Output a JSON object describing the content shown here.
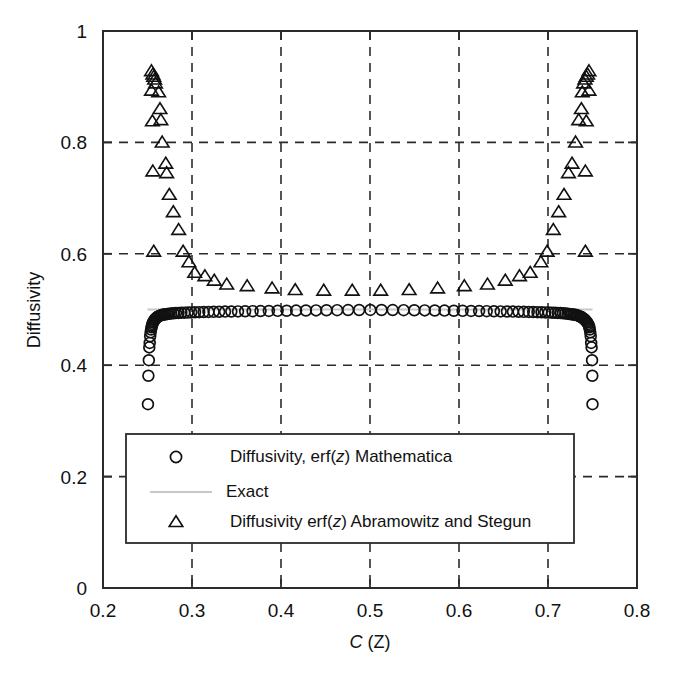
{
  "figure": {
    "background": "#ffffff",
    "axis_color": "#2b2b2b",
    "marker_color": "#111111",
    "exact_color": "#c8c8c8"
  },
  "chart_data": {
    "type": "scatter",
    "title": "",
    "xlabel": "C (Z)",
    "xlabel_italic_part": "C",
    "xlabel_rest": " (Z)",
    "ylabel": "Diffusivity",
    "xlim": [
      0.2,
      0.8
    ],
    "ylim": [
      0,
      1
    ],
    "xticks": [
      0.2,
      0.3,
      0.4,
      0.5,
      0.6,
      0.7,
      0.8
    ],
    "xtick_labels": [
      "0.2",
      "0.3",
      "0.4",
      "0.5",
      "0.6",
      "0.7",
      "0.8"
    ],
    "yticks": [
      0,
      0.2,
      0.4,
      0.6,
      0.8,
      1
    ],
    "ytick_labels": [
      "0",
      "0.2",
      "0.4",
      "0.6",
      "0.8",
      "1"
    ],
    "grid": true,
    "grid_style": "dashed",
    "legend_position": "lower-center",
    "series": [
      {
        "name": "Diffusivity, erf(z) Mathematica",
        "marker": "circle",
        "points": [
          [
            0.2505,
            0.33
          ],
          [
            0.251,
            0.381
          ],
          [
            0.2515,
            0.409
          ],
          [
            0.252,
            0.432
          ],
          [
            0.2525,
            0.44
          ],
          [
            0.253,
            0.452
          ],
          [
            0.2535,
            0.459
          ],
          [
            0.254,
            0.464
          ],
          [
            0.2545,
            0.468
          ],
          [
            0.255,
            0.471
          ],
          [
            0.2556,
            0.474
          ],
          [
            0.2562,
            0.477
          ],
          [
            0.257,
            0.479
          ],
          [
            0.2578,
            0.481
          ],
          [
            0.2586,
            0.483
          ],
          [
            0.2595,
            0.484
          ],
          [
            0.2605,
            0.486
          ],
          [
            0.2616,
            0.487
          ],
          [
            0.2628,
            0.488
          ],
          [
            0.2641,
            0.489
          ],
          [
            0.2655,
            0.49
          ],
          [
            0.267,
            0.4905
          ],
          [
            0.2686,
            0.491
          ],
          [
            0.2704,
            0.4915
          ],
          [
            0.2723,
            0.492
          ],
          [
            0.2744,
            0.4925
          ],
          [
            0.2767,
            0.493
          ],
          [
            0.2792,
            0.4932
          ],
          [
            0.2819,
            0.4935
          ],
          [
            0.2848,
            0.4938
          ],
          [
            0.288,
            0.494
          ],
          [
            0.2914,
            0.4943
          ],
          [
            0.2951,
            0.4945
          ],
          [
            0.2991,
            0.4948
          ],
          [
            0.3034,
            0.495
          ],
          [
            0.3081,
            0.4952
          ],
          [
            0.3131,
            0.4954
          ],
          [
            0.3185,
            0.4956
          ],
          [
            0.3243,
            0.4958
          ],
          [
            0.3305,
            0.496
          ],
          [
            0.3371,
            0.4962
          ],
          [
            0.3442,
            0.4964
          ],
          [
            0.3517,
            0.4966
          ],
          [
            0.3597,
            0.4968
          ],
          [
            0.3681,
            0.497
          ],
          [
            0.377,
            0.4972
          ],
          [
            0.3864,
            0.4974
          ],
          [
            0.3962,
            0.4976
          ],
          [
            0.4064,
            0.4978
          ],
          [
            0.417,
            0.498
          ],
          [
            0.428,
            0.4982
          ],
          [
            0.4394,
            0.4984
          ],
          [
            0.4511,
            0.4986
          ],
          [
            0.4631,
            0.4988
          ],
          [
            0.4754,
            0.499
          ],
          [
            0.4878,
            0.4991
          ],
          [
            0.5004,
            0.4992
          ],
          [
            0.513,
            0.4991
          ],
          [
            0.5255,
            0.499
          ],
          [
            0.5378,
            0.4988
          ],
          [
            0.5498,
            0.4986
          ],
          [
            0.5615,
            0.4984
          ],
          [
            0.5728,
            0.4982
          ],
          [
            0.5837,
            0.498
          ],
          [
            0.5942,
            0.4978
          ],
          [
            0.6041,
            0.4976
          ],
          [
            0.6136,
            0.4974
          ],
          [
            0.6226,
            0.4972
          ],
          [
            0.6311,
            0.497
          ],
          [
            0.6392,
            0.4968
          ],
          [
            0.6468,
            0.4966
          ],
          [
            0.6539,
            0.4964
          ],
          [
            0.6606,
            0.4962
          ],
          [
            0.6669,
            0.496
          ],
          [
            0.6728,
            0.4958
          ],
          [
            0.6783,
            0.4956
          ],
          [
            0.6834,
            0.4954
          ],
          [
            0.6882,
            0.4952
          ],
          [
            0.6927,
            0.495
          ],
          [
            0.6969,
            0.4948
          ],
          [
            0.7008,
            0.4945
          ],
          [
            0.7045,
            0.4943
          ],
          [
            0.7079,
            0.494
          ],
          [
            0.7111,
            0.4938
          ],
          [
            0.7141,
            0.4935
          ],
          [
            0.7169,
            0.4932
          ],
          [
            0.7195,
            0.493
          ],
          [
            0.7219,
            0.4925
          ],
          [
            0.7242,
            0.492
          ],
          [
            0.7264,
            0.4915
          ],
          [
            0.7284,
            0.491
          ],
          [
            0.7303,
            0.4905
          ],
          [
            0.7321,
            0.49
          ],
          [
            0.7337,
            0.489
          ],
          [
            0.7353,
            0.488
          ],
          [
            0.7367,
            0.487
          ],
          [
            0.7381,
            0.486
          ],
          [
            0.7394,
            0.484
          ],
          [
            0.7406,
            0.483
          ],
          [
            0.7418,
            0.481
          ],
          [
            0.7429,
            0.479
          ],
          [
            0.744,
            0.477
          ],
          [
            0.745,
            0.474
          ],
          [
            0.746,
            0.471
          ],
          [
            0.7465,
            0.468
          ],
          [
            0.747,
            0.464
          ],
          [
            0.7475,
            0.459
          ],
          [
            0.748,
            0.452
          ],
          [
            0.7485,
            0.44
          ],
          [
            0.749,
            0.432
          ],
          [
            0.7495,
            0.409
          ],
          [
            0.7498,
            0.381
          ],
          [
            0.75,
            0.33
          ]
        ]
      },
      {
        "name": "Exact",
        "marker": "line",
        "style": "solid-gray",
        "points": [
          [
            0.25,
            0.5
          ],
          [
            0.75,
            0.5
          ]
        ]
      },
      {
        "name": "Diffusivity erf(z) Abramowitz and Stegun",
        "marker": "triangle",
        "points": [
          [
            0.2545,
            0.928
          ],
          [
            0.256,
            0.922
          ],
          [
            0.257,
            0.918
          ],
          [
            0.258,
            0.913
          ],
          [
            0.259,
            0.906
          ],
          [
            0.2545,
            0.893
          ],
          [
            0.2625,
            0.89
          ],
          [
            0.264,
            0.86
          ],
          [
            0.2555,
            0.838
          ],
          [
            0.265,
            0.84
          ],
          [
            0.2665,
            0.8
          ],
          [
            0.2705,
            0.762
          ],
          [
            0.256,
            0.748
          ],
          [
            0.2715,
            0.745
          ],
          [
            0.2745,
            0.706
          ],
          [
            0.279,
            0.675
          ],
          [
            0.285,
            0.643
          ],
          [
            0.29,
            0.604
          ],
          [
            0.257,
            0.604
          ],
          [
            0.2965,
            0.585
          ],
          [
            0.303,
            0.566
          ],
          [
            0.3145,
            0.56
          ],
          [
            0.325,
            0.552
          ],
          [
            0.339,
            0.545
          ],
          [
            0.362,
            0.542
          ],
          [
            0.39,
            0.538
          ],
          [
            0.416,
            0.535
          ],
          [
            0.448,
            0.534
          ],
          [
            0.48,
            0.534
          ],
          [
            0.512,
            0.534
          ],
          [
            0.544,
            0.535
          ],
          [
            0.576,
            0.538
          ],
          [
            0.606,
            0.542
          ],
          [
            0.632,
            0.545
          ],
          [
            0.652,
            0.552
          ],
          [
            0.668,
            0.56
          ],
          [
            0.68,
            0.566
          ],
          [
            0.692,
            0.585
          ],
          [
            0.699,
            0.604
          ],
          [
            0.742,
            0.604
          ],
          [
            0.706,
            0.643
          ],
          [
            0.712,
            0.675
          ],
          [
            0.718,
            0.706
          ],
          [
            0.723,
            0.745
          ],
          [
            0.742,
            0.748
          ],
          [
            0.727,
            0.762
          ],
          [
            0.731,
            0.8
          ],
          [
            0.7345,
            0.84
          ],
          [
            0.743,
            0.838
          ],
          [
            0.7375,
            0.86
          ],
          [
            0.7385,
            0.89
          ],
          [
            0.746,
            0.893
          ],
          [
            0.74,
            0.906
          ],
          [
            0.7415,
            0.913
          ],
          [
            0.743,
            0.918
          ],
          [
            0.7445,
            0.922
          ],
          [
            0.746,
            0.928
          ]
        ]
      }
    ]
  },
  "legend": {
    "entries": [
      {
        "marker": "circle",
        "label_prefix": "Diffusivity, erf(",
        "label_italic": "z",
        "label_suffix": ") Mathematica",
        "label_full": "Diffusivity, erf(z) Mathematica"
      },
      {
        "marker": "line",
        "label_prefix": "Exact",
        "label_italic": "",
        "label_suffix": "",
        "label_full": "Exact"
      },
      {
        "marker": "triangle",
        "label_prefix": "Diffusivity erf(",
        "label_italic": "z",
        "label_suffix": ") Abramowitz and Stegun",
        "label_full": "Diffusivity erf(z) Abramowitz and Stegun"
      }
    ]
  }
}
